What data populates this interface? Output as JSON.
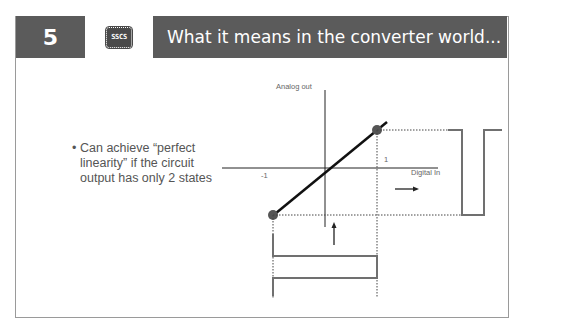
{
  "slide": {
    "number": "5",
    "logo_text": "SSCS",
    "title": "What it means in the converter world..."
  },
  "bullets": [
    {
      "text": "Can achieve “perfect linearity” if the circuit output has only 2 states"
    }
  ],
  "diagram": {
    "y_axis_label": "Analog out",
    "x_axis_label": "Digital In",
    "tick_neg": "-1",
    "tick_pos": "1",
    "transfer_points": [
      [
        -1,
        -1
      ],
      [
        1,
        1
      ]
    ],
    "colors": {
      "axis": "#222222",
      "waveform": "#707070",
      "dot": "#555555",
      "dotted": "#444444"
    }
  }
}
